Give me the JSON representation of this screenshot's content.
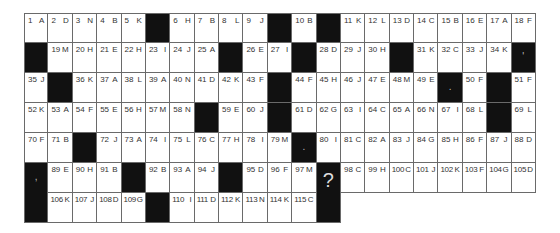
{
  "puzzle": {
    "type": "acrostic",
    "columns": 21,
    "rows": [
      [
        "1 A",
        "2 D",
        "3 N",
        "4 B",
        "5 K",
        "#",
        "6 H",
        "7 B",
        "8 L",
        "9 J",
        "#",
        "10 B",
        "#",
        "11 K",
        "12 L",
        "13 D",
        "14 C",
        "15 B",
        "16 E",
        "17 A",
        "18 F"
      ],
      [
        "#",
        "19 M",
        "20 H",
        "21 E",
        "22 H",
        "23 I",
        "24 J",
        "25 A",
        "#",
        "26 E",
        "27 I",
        "#",
        "28 D",
        "29 J",
        "30 H",
        "#",
        "31 K",
        "32 C",
        "33 J",
        "34 K",
        "#'"
      ],
      [
        "35 J",
        "#",
        "36 K",
        "37 A",
        "38 L",
        "39 A",
        "40 N",
        "41 D",
        "42 K",
        "43 F",
        "#",
        "44 F",
        "45 H",
        "46 J",
        "47 E",
        "48 M",
        "49 E",
        "#.",
        "50 F",
        "#",
        "51 F"
      ],
      [
        "52 K",
        "53 A",
        "54 F",
        "55 E",
        "56 H",
        "57 M",
        "58 N",
        "#",
        "59 E",
        "60 J",
        "#",
        "61 D",
        "62 G",
        "63 I",
        "64 C",
        "65 A",
        "66 N",
        "67 I",
        "68 L",
        "#",
        "69 L"
      ],
      [
        "70 F",
        "71 B",
        "#",
        "72 J",
        "73 A",
        "74 I",
        "75 L",
        "76 C",
        "77 H",
        "78 I",
        "79 M",
        "#.",
        "80 I",
        "81 C",
        "82 A",
        "83 J",
        "84 G",
        "85 H",
        "86 F",
        "87 J",
        "88 D"
      ],
      [
        "#,",
        "89 E",
        "90 H",
        "91 B",
        "#",
        "92 B",
        "93 A",
        "94 J",
        "#",
        "95 D",
        "96 F",
        "97 M",
        "#",
        "98 C",
        "99 H",
        "100 C",
        "101 J",
        "102 K",
        "103 F",
        "104 G",
        "105 D"
      ],
      [
        "#",
        "106 K",
        "107 J",
        "108 D",
        "109 G",
        "#",
        "110 I",
        "111 D",
        "112 K",
        "113 N",
        "114 K",
        "115 C",
        "#?"
      ]
    ],
    "end_marker": "?"
  },
  "colors": {
    "black_cell": "#111111",
    "grid_line": "#6a6a6a",
    "text": "#333333"
  }
}
